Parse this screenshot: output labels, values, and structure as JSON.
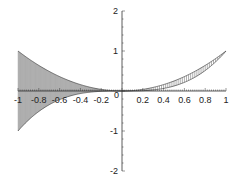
{
  "chart_data": {
    "type": "area",
    "title": "",
    "xlabel": "",
    "ylabel": "",
    "xlim": [
      -1,
      1
    ],
    "ylim": [
      -2,
      2
    ],
    "grid": false,
    "legend": null,
    "x_ticks": [
      "-1",
      "-0.8",
      "-0.6",
      "-0.4",
      "-0.2",
      "0.2",
      "0.4",
      "0.6",
      "0.8",
      "1"
    ],
    "x_tick_values": [
      -1,
      -0.8,
      -0.6,
      -0.4,
      -0.2,
      0.2,
      0.4,
      0.6,
      0.8,
      1
    ],
    "y_ticks": [
      "2",
      "1",
      "-1",
      "-2"
    ],
    "y_tick_values": [
      2,
      1,
      -1,
      -2
    ],
    "origin_label": "0",
    "series": [
      {
        "name": "x^2",
        "x": [
          -1,
          -0.8,
          -0.6,
          -0.4,
          -0.2,
          0,
          0.2,
          0.4,
          0.6,
          0.8,
          1
        ],
        "values": [
          1,
          0.64,
          0.36,
          0.16,
          0.04,
          0,
          0.04,
          0.16,
          0.36,
          0.64,
          1
        ]
      },
      {
        "name": "x^3",
        "x": [
          -1,
          -0.8,
          -0.6,
          -0.4,
          -0.2,
          0,
          0.2,
          0.4,
          0.6,
          0.8,
          1
        ],
        "values": [
          -1,
          -0.512,
          -0.216,
          -0.064,
          -0.008,
          0,
          0.008,
          0.064,
          0.216,
          0.512,
          1
        ]
      }
    ],
    "regions": [
      {
        "name": "left-region",
        "x_range": [
          -1,
          0
        ],
        "between": [
          "x^2",
          "x^3"
        ],
        "fill": "solid-gray",
        "color": "#b8b8b8"
      },
      {
        "name": "right-region",
        "x_range": [
          0,
          1
        ],
        "between": [
          "x^2",
          "x^3"
        ],
        "fill": "vertical-hatch",
        "color": "#777777"
      }
    ]
  }
}
